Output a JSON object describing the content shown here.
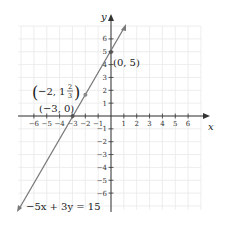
{
  "chart_data": {
    "type": "line",
    "title": "",
    "xlabel": "x",
    "ylabel": "y",
    "xlim": [
      -7,
      7
    ],
    "ylim": [
      -7,
      7
    ],
    "grid": true,
    "x_ticks": [
      -6,
      -5,
      -4,
      -3,
      -2,
      -1,
      1,
      2,
      3,
      4,
      5,
      6
    ],
    "y_ticks": [
      -6,
      -5,
      -4,
      -3,
      -2,
      -1,
      1,
      2,
      3,
      4,
      5,
      6
    ],
    "series": [
      {
        "name": "-5x + 3y = 15",
        "equation": "-5x + 3y = 15",
        "slope": 1.6667,
        "intercept": 5,
        "points": [
          {
            "x": -3,
            "y": 0,
            "label": "(-3, 0)"
          },
          {
            "x": -2,
            "y": 1.6667,
            "label": "(-2, 1 2/3)"
          },
          {
            "x": 0,
            "y": 5,
            "label": "(0, 5)"
          }
        ],
        "color": "#7a7a7a"
      }
    ]
  },
  "labels": {
    "x_axis": "x",
    "y_axis": "y",
    "equation": "−5x + 3y = 15",
    "point_a": "(−3, 0)",
    "point_b_prefix": "−2, 1",
    "point_b_num": "2",
    "point_b_den": "3",
    "point_c": "(0, 5)",
    "x_ticks": [
      "−6",
      "−5",
      "−4",
      "−3",
      "−2",
      "−1",
      "1",
      "2",
      "3",
      "4",
      "5",
      "6"
    ],
    "y_ticks_pos": [
      "1",
      "2",
      "3",
      "4",
      "5",
      "6"
    ],
    "y_ticks_neg": [
      "−1",
      "−2",
      "−3",
      "−4",
      "−5",
      "−6"
    ]
  },
  "colors": {
    "grid": "#e8e8e8",
    "axis": "#333333",
    "line": "#7a7a7a",
    "point": "#8a8a8a"
  }
}
